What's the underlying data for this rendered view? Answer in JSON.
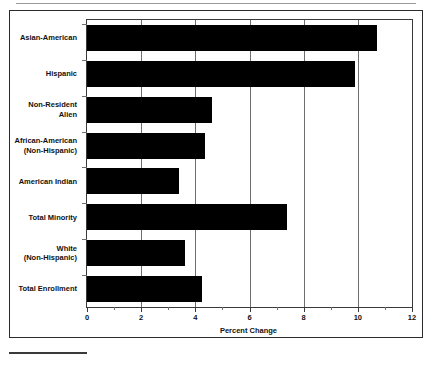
{
  "chart_data": {
    "type": "bar",
    "orientation": "horizontal",
    "title": "",
    "xlabel": "Percent Change",
    "ylabel": "",
    "xlim": [
      0,
      12
    ],
    "xticks": [
      0,
      2,
      4,
      6,
      8,
      10,
      12
    ],
    "xtick_labels": [
      "0",
      "2",
      "4",
      "6",
      "8",
      "10",
      "12"
    ],
    "minor_xticks": [
      1,
      3,
      5,
      7,
      9,
      11
    ],
    "grid": "vertical",
    "legend": "none",
    "bar_color": "#000000",
    "categories": [
      "Asian-American",
      "Hispanic",
      "Non-Resident\nAlien",
      "African-American\n(Non-Hispanic)",
      "American Indian",
      "Total Minority",
      "White\n(Non-Hispanic)",
      "Total Enrollment"
    ],
    "values": [
      10.7,
      9.9,
      4.6,
      4.35,
      3.4,
      7.4,
      3.6,
      4.25
    ]
  },
  "footer": {
    "rule": "",
    "note": ""
  }
}
